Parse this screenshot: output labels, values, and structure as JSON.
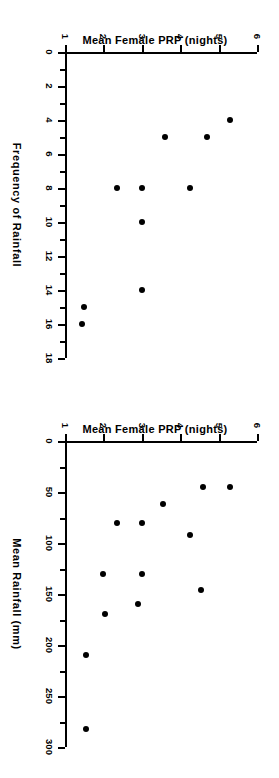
{
  "figure": {
    "background": "#ffffff",
    "marker_color": "#000000",
    "axis_color": "#000000",
    "orientation_note": "page rotated 90 degrees; both panels read sideways"
  },
  "panels": [
    {
      "id": "frequency",
      "name": "Mean Female PRP vs Frequency of Rainfall"
    },
    {
      "id": "rainfall",
      "name": "Mean Female PRP vs Mean Rainfall"
    }
  ],
  "chart_data": [
    {
      "type": "scatter",
      "title": "",
      "xlabel": "Frequency  of  Rainfall",
      "ylabel": "Mean Female PRP (nights)",
      "xlim": [
        0,
        18
      ],
      "ylim": [
        1,
        6
      ],
      "xticks": [
        0,
        2,
        4,
        6,
        8,
        10,
        12,
        14,
        16,
        18
      ],
      "xticklabels": [
        "0",
        "2",
        "4",
        "6",
        "8",
        "10",
        "12",
        "14",
        "16",
        "18"
      ],
      "xminorticks": [
        1,
        3,
        5,
        7,
        9,
        11,
        13,
        15,
        17
      ],
      "yticks": [
        1,
        2,
        3,
        4,
        5,
        6
      ],
      "yticklabels": [
        "1",
        "2",
        "3",
        "4",
        "5",
        "6"
      ],
      "grid": false,
      "legend": "none",
      "points": [
        {
          "x": 4,
          "y": 5.3
        },
        {
          "x": 5,
          "y": 4.7
        },
        {
          "x": 5,
          "y": 3.6
        },
        {
          "x": 8,
          "y": 4.25
        },
        {
          "x": 8,
          "y": 3.0
        },
        {
          "x": 8,
          "y": 2.35
        },
        {
          "x": 10,
          "y": 3.0
        },
        {
          "x": 14,
          "y": 3.0
        },
        {
          "x": 15,
          "y": 1.5
        },
        {
          "x": 16,
          "y": 1.45
        }
      ]
    },
    {
      "type": "scatter",
      "title": "",
      "xlabel": "Mean  Rainfall  (mm)",
      "ylabel": "Mean Female PRP (nights)",
      "xlim": [
        0,
        300
      ],
      "ylim": [
        1,
        6
      ],
      "xticks": [
        0,
        50,
        100,
        150,
        200,
        250,
        300
      ],
      "xticklabels": [
        "0",
        "50",
        "100",
        "150",
        "200",
        "250",
        "300"
      ],
      "xminorticks": [
        25,
        75,
        125,
        175,
        225,
        275
      ],
      "yticks": [
        1,
        2,
        3,
        4,
        5,
        6
      ],
      "yticklabels": [
        "1",
        "2",
        "3",
        "4",
        "5",
        "6"
      ],
      "grid": false,
      "legend": "none",
      "points": [
        {
          "x": 45,
          "y": 5.3
        },
        {
          "x": 45,
          "y": 4.6
        },
        {
          "x": 62,
          "y": 3.55
        },
        {
          "x": 80,
          "y": 3.0
        },
        {
          "x": 80,
          "y": 2.35
        },
        {
          "x": 92,
          "y": 4.25
        },
        {
          "x": 130,
          "y": 3.0
        },
        {
          "x": 130,
          "y": 2.0
        },
        {
          "x": 146,
          "y": 4.55
        },
        {
          "x": 160,
          "y": 2.9
        },
        {
          "x": 170,
          "y": 2.05
        },
        {
          "x": 210,
          "y": 1.55
        },
        {
          "x": 282,
          "y": 1.55
        }
      ]
    }
  ]
}
